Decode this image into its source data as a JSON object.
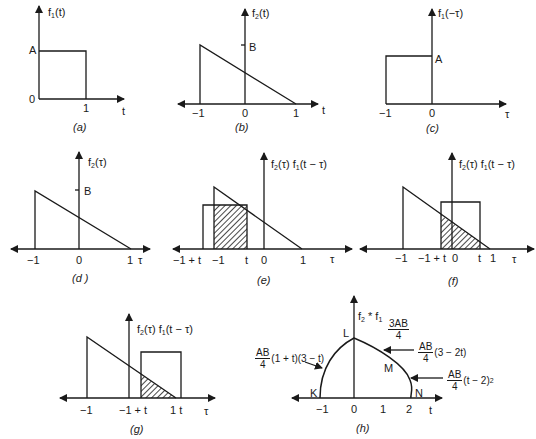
{
  "figure": {
    "panels": [
      {
        "id": "a",
        "caption": "(a)",
        "y_label": "f1(t)",
        "x_label": "t",
        "ticks_x": [
          "0",
          "1"
        ],
        "ticks_y": [
          "A"
        ],
        "shape": "rectangle from t=0 to t=1, height A"
      },
      {
        "id": "b",
        "caption": "(b)",
        "y_label": "f2(t)",
        "x_label": "t",
        "ticks_x": [
          "-1",
          "0",
          "1"
        ],
        "ticks_y": [
          "B"
        ],
        "shape": "triangle from t=-1 (height B) down to t=1"
      },
      {
        "id": "c",
        "caption": "(c)",
        "y_label": "f1(-τ)",
        "x_label": "τ",
        "ticks_x": [
          "-1",
          "0"
        ],
        "ticks_y": [
          "A"
        ],
        "shape": "rectangle from τ=-1 to τ=0, height A"
      },
      {
        "id": "d",
        "caption": "(d)",
        "y_label": "f2(τ)",
        "x_label": "τ",
        "ticks_x": [
          "-1",
          "0",
          "1"
        ],
        "ticks_y": [
          "B"
        ],
        "shape": "triangle from τ=-1 (height B) down to τ=1"
      },
      {
        "id": "e",
        "caption": "(e)",
        "y_label": "f2(τ) f1(t − τ)",
        "x_label": "τ",
        "ticks_x": [
          "-1 + t",
          "-1",
          "t",
          "0",
          "1"
        ],
        "shape": "overlap shaded from -1 to t"
      },
      {
        "id": "f",
        "caption": "(f)",
        "y_label": "f2(τ) f1(t − τ)",
        "x_label": "τ",
        "ticks_x": [
          "-1",
          "-1 + t",
          "0",
          "t",
          "1"
        ],
        "shape": "overlap shaded from -1+t to t"
      },
      {
        "id": "g",
        "caption": "(g)",
        "y_label": "f2(τ) f1(t − τ)",
        "x_label": "τ",
        "ticks_x": [
          "-1",
          "-1 + t",
          "1",
          "t"
        ],
        "shape": "overlap shaded from -1+t to 1"
      },
      {
        "id": "h",
        "caption": "(h)",
        "y_label": "f2 * f1",
        "x_label": "t",
        "ticks_x": [
          "-1",
          "0",
          "1",
          "2"
        ],
        "points": [
          "K",
          "L",
          "M",
          "N"
        ],
        "peak_label": {
          "num": "3AB",
          "den": "4"
        },
        "annotations": [
          {
            "num": "AB",
            "den": "4",
            "expr": "(1 + t)(3 − t)"
          },
          {
            "num": "AB",
            "den": "4",
            "expr": "(3 − 2t)"
          },
          {
            "num": "AB",
            "den": "4",
            "expr": "(t − 2)",
            "sup": "2"
          }
        ]
      }
    ]
  },
  "text": {
    "a": {
      "f": "f",
      "sub": "1",
      "arg": "(t)",
      "A": "A",
      "zero": "0",
      "one": "1",
      "x": "t",
      "cap": "(a)"
    },
    "b": {
      "f": "f",
      "sub": "2",
      "arg": "(t)",
      "B": "B",
      "m1": "−1",
      "zero": "0",
      "one": "1",
      "x": "t",
      "cap": "(b)"
    },
    "c": {
      "f": "f",
      "sub": "1",
      "arg": "(−τ)",
      "A": "A",
      "m1": "−1",
      "zero": "0",
      "x": "τ",
      "cap": "(c)"
    },
    "d": {
      "f": "f",
      "sub": "2",
      "arg": "(τ)",
      "B": "B",
      "m1": "−1",
      "zero": "0",
      "one": "1",
      "x": "τ",
      "cap": "(d )"
    },
    "e": {
      "l1": "f",
      "s1": "2",
      "l2": "(τ) f",
      "s2": "1",
      "l3": "(t − τ)",
      "m1t": "−1 + t",
      "m1": "−1",
      "t": "t",
      "zero": "0",
      "one": "1",
      "x": "τ",
      "cap": "(e)"
    },
    "f": {
      "l1": "f",
      "s1": "2",
      "l2": "(τ) f",
      "s2": "1",
      "l3": "(t − τ)",
      "m1": "−1",
      "m1t": "−1 + t",
      "zero": "0",
      "t": "t",
      "one": "1",
      "x": "τ",
      "cap": "(f)"
    },
    "g": {
      "l1": "f",
      "s1": "2",
      "l2": "(τ) f",
      "s2": "1",
      "l3": "(t − τ)",
      "m1": "−1",
      "m1t": "−1 + t",
      "onet": "1 t",
      "x": "τ",
      "cap": "(g)"
    },
    "h": {
      "l1": "f",
      "s1": "2",
      "l2": " * f",
      "s2": "1",
      "L": "L",
      "K": "K",
      "M": "M",
      "N": "N",
      "m1": "−1",
      "zero": "0",
      "one": "1",
      "two": "2",
      "x": "t",
      "cap": "(h)",
      "peak_num": "3AB",
      "peak_den": "4",
      "ann1_num": "AB",
      "ann1_den": "4",
      "ann1_expr": "(1 + t)(3 − t)",
      "ann2_num": "AB",
      "ann2_den": "4",
      "ann2_expr": "(3 − 2t)",
      "ann3_num": "AB",
      "ann3_den": "4",
      "ann3_expr": "(t − 2)",
      "ann3_sup": "2"
    }
  },
  "colors": {
    "ink": "#1a1a1a",
    "background": "#ffffff"
  }
}
